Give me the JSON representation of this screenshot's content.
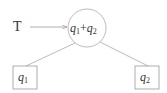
{
  "diagram": {
    "input_label": "T",
    "root": {
      "var1": "q",
      "sub1": "1",
      "op": "+",
      "var2": "q",
      "sub2": "2"
    },
    "left_leaf": {
      "var": "q",
      "sub": "1"
    },
    "right_leaf": {
      "var": "q",
      "sub": "2"
    },
    "colors": {
      "stroke": "#999999",
      "text": "#333333"
    }
  }
}
